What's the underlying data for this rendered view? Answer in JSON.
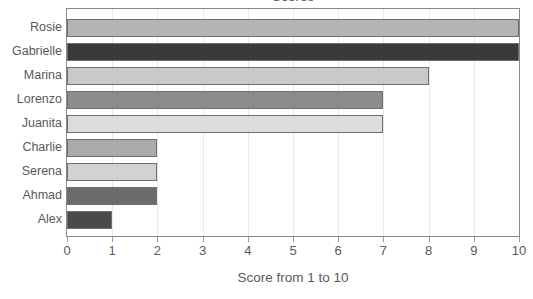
{
  "chart_data": {
    "type": "bar",
    "orientation": "horizontal",
    "title": "Scores",
    "xlabel": "Score from 1 to 10",
    "ylabel": "",
    "categories": [
      "Rosie",
      "Gabrielle",
      "Marina",
      "Lorenzo",
      "Juanita",
      "Charlie",
      "Serena",
      "Ahmad",
      "Alex"
    ],
    "values": [
      10,
      10,
      8,
      7,
      7,
      2,
      2,
      2,
      1
    ],
    "bar_colors": [
      "#b4b4b4",
      "#3a3a3a",
      "#c9c9c9",
      "#8c8c8c",
      "#dcdcdc",
      "#aaaaaa",
      "#d2d2d2",
      "#6b6b6b",
      "#4a4a4a"
    ],
    "bar_border_color": "#6e6e6e",
    "xlim": [
      0,
      10
    ],
    "x_ticks": [
      0,
      1,
      2,
      3,
      4,
      5,
      6,
      7,
      8,
      9,
      10
    ],
    "x_tick_labels": [
      "0",
      "1",
      "2",
      "3",
      "4",
      "5",
      "6",
      "7",
      "8",
      "9",
      "10"
    ],
    "grid": true,
    "gridline_color": "#e9e9e9",
    "frame_color": "#8a8a8a",
    "legend": false,
    "background": "#ffffff",
    "text_color": "#58595b"
  }
}
